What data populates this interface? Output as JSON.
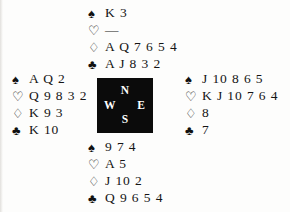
{
  "diagram": {
    "type": "bridge-deal",
    "suit_glyphs": {
      "spades": "♠",
      "hearts": "♡",
      "diamonds": "♢",
      "clubs": "♣"
    },
    "compass": {
      "north": "N",
      "west": "W",
      "east": "E",
      "south": "S"
    },
    "hands": {
      "north": {
        "label": "North",
        "spades": "K 3",
        "hearts": "—",
        "diamonds": "A Q 7 6 5 4",
        "clubs": "A J 8 3 2"
      },
      "west": {
        "label": "West",
        "spades": "A Q 2",
        "hearts": "Q 9 8 3 2",
        "diamonds": "K 9 3",
        "clubs": "K 10"
      },
      "east": {
        "label": "East",
        "spades": "J 10 8 6 5",
        "hearts": "K J 10 7 6 4",
        "diamonds": "8",
        "clubs": "7"
      },
      "south": {
        "label": "South",
        "spades": "9 7 4",
        "hearts": "A 5",
        "diamonds": "J 10 2",
        "clubs": "Q 9 6 5 4"
      }
    }
  }
}
